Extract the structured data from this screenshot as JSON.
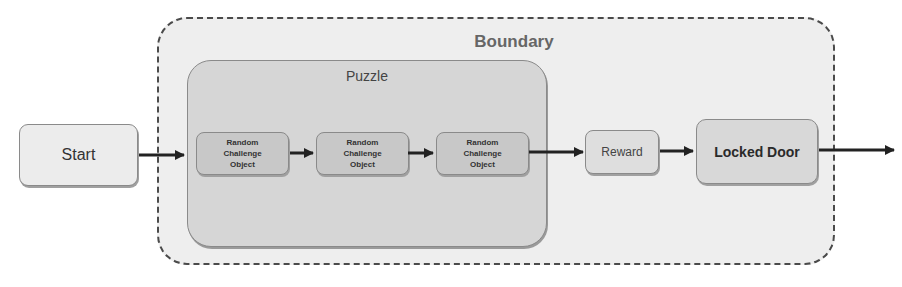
{
  "diagram": {
    "boundary": {
      "label": "Boundary"
    },
    "puzzle": {
      "label": "Puzzle"
    },
    "nodes": {
      "start": {
        "label": "Start"
      },
      "rco_1": {
        "label": "Random\nChallenge\nObject"
      },
      "rco_2": {
        "label": "Random\nChallenge\nObject"
      },
      "rco_3": {
        "label": "Random\nChallenge\nObject"
      },
      "reward": {
        "label": "Reward"
      },
      "locked_door": {
        "label": "Locked Door"
      }
    },
    "edges": [
      {
        "from": "Start",
        "to": "Random Challenge Object 1"
      },
      {
        "from": "Random Challenge Object 1",
        "to": "Random Challenge Object 2"
      },
      {
        "from": "Random Challenge Object 2",
        "to": "Random Challenge Object 3"
      },
      {
        "from": "Random Challenge Object 3",
        "to": "Reward"
      },
      {
        "from": "Reward",
        "to": "Locked Door"
      },
      {
        "from": "Locked Door",
        "to": "exit"
      }
    ],
    "colors": {
      "boundary_border": "#4a4a4a",
      "boundary_fill": "#eeeeee",
      "puzzle_fill": "#d6d6d6",
      "node_border": "#8a8a8a",
      "arrow": "#222222"
    }
  }
}
